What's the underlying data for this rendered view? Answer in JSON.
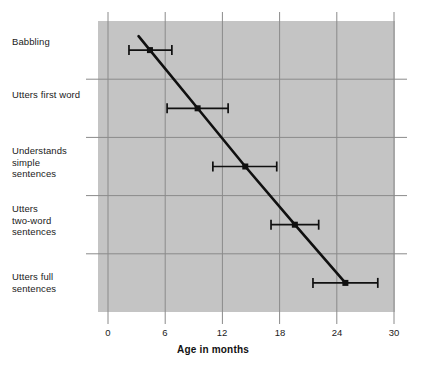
{
  "chart_data": {
    "type": "line",
    "title": "",
    "xlabel": "Age in months",
    "ylabel": "",
    "xlim": [
      0,
      30
    ],
    "xticks": [
      0,
      6,
      12,
      18,
      24,
      30
    ],
    "xtick_labels": [
      "0",
      "6",
      "12",
      "18",
      "24",
      "30"
    ],
    "grid": true,
    "legend": "none",
    "orientation": "horizontal-categories",
    "categories": [
      "Babbling",
      "Utters first word",
      "Understands\nsimple\nsentences",
      "Utters\ntwo-word\nsentences",
      "Utters full\nsentences"
    ],
    "series": [
      {
        "name": "Age at milestone",
        "values": [
          4.4,
          9.4,
          14.4,
          19.6,
          24.9
        ],
        "error_low": [
          2.2,
          6.2,
          11.0,
          17.1,
          21.5
        ],
        "error_high": [
          6.7,
          12.6,
          17.7,
          22.1,
          28.3
        ]
      }
    ],
    "points": [
      {
        "category": "Babbling",
        "value": 4.4,
        "low": 2.2,
        "high": 6.7
      },
      {
        "category": "Utters first word",
        "value": 9.4,
        "low": 6.2,
        "high": 12.6
      },
      {
        "category": "Understands simple sentences",
        "value": 14.4,
        "low": 11.0,
        "high": 17.7
      },
      {
        "category": "Utters two-word sentences",
        "value": 19.6,
        "low": 17.1,
        "high": 22.1
      },
      {
        "category": "Utters full sentences",
        "value": 24.9,
        "low": 21.5,
        "high": 28.3
      }
    ],
    "colors": {
      "plot_background": "#c4c4c4",
      "figure_background": "#ffffff",
      "line": "#101010",
      "marker": "#101010",
      "errorbar": "#101010",
      "gridline": "#8a8a8a",
      "text": "#1a1a1a"
    }
  },
  "axis": {
    "x_tick_labels": [
      "0",
      "6",
      "12",
      "18",
      "24",
      "30"
    ],
    "x_title": "Age in months"
  },
  "categories": {
    "c0": "Babbling",
    "c1": "Utters first word",
    "c2": "Understands\nsimple\nsentences",
    "c3": "Utters\ntwo-word\nsentences",
    "c4": "Utters full\nsentences"
  }
}
